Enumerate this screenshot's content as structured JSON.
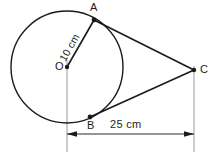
{
  "figure": {
    "type": "geometry-diagram",
    "background_color": "#ffffff",
    "stroke_color": "#1a1a1a",
    "guide_color": "#9a9a9a",
    "labels": {
      "center": "O",
      "tangent_point_top": "A",
      "tangent_point_bottom": "B",
      "external_point": "C"
    },
    "measurements": {
      "radius": "10 cm",
      "distance": "25 cm"
    },
    "geometry": {
      "circle": {
        "cx": 67,
        "cy": 67,
        "r": 56
      },
      "points": {
        "O": {
          "x": 67,
          "y": 67
        },
        "A": {
          "x": 94,
          "y": 20
        },
        "B": {
          "x": 90,
          "y": 117
        },
        "C": {
          "x": 194,
          "y": 70
        }
      },
      "dimension_line": {
        "x1": 67,
        "x2": 194,
        "y": 134
      },
      "extension_lines": [
        {
          "x": 67,
          "y1": 67,
          "y2": 152
        },
        {
          "x": 194,
          "y1": 70,
          "y2": 152
        }
      ]
    }
  }
}
